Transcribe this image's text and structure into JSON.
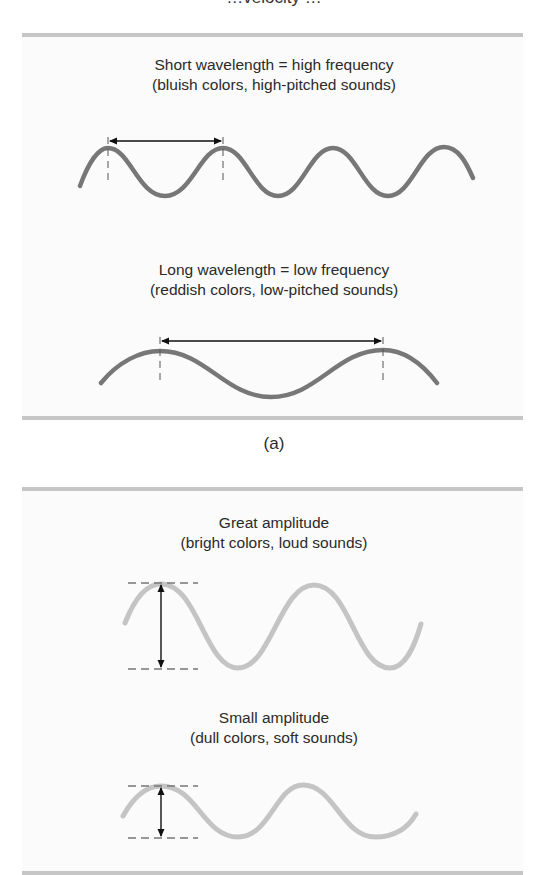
{
  "top_clipped_text": "…velocity …",
  "panel_a": {
    "label": "(a)",
    "short": {
      "title": "Short wavelength = high frequency",
      "subtitle": "(bluish colors, high-pitched sounds)"
    },
    "long": {
      "title": "Long wavelength = low frequency",
      "subtitle": "(reddish colors, low-pitched sounds)"
    }
  },
  "panel_b": {
    "great": {
      "title": "Great amplitude",
      "subtitle": "(bright colors, loud sounds)"
    },
    "small": {
      "title": "Small amplitude",
      "subtitle": "(dull colors, soft sounds)"
    }
  },
  "colors": {
    "dark_wave": "#777777",
    "light_wave": "#c4c4c4",
    "rule_bar": "#c6c6c6",
    "arrow": "#111111",
    "dash": "#777777"
  }
}
